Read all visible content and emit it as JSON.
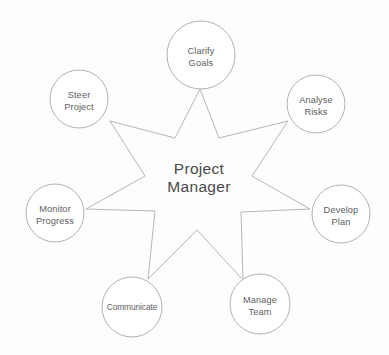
{
  "diagram": {
    "type": "star-hub-and-spoke",
    "center": {
      "name": "center-node",
      "line1": "Project",
      "line2": "Manager",
      "x": 199,
      "y": 174
    },
    "stroke_color": "#a8a8a8",
    "text_color": "#5d5d5d",
    "center_text_color": "#4a4a4a",
    "background_color": "#fdfdfd",
    "nodes": [
      {
        "id": "clarify-goals",
        "line1": "Clarify",
        "line2": "Goals",
        "cx": 201,
        "cy": 55,
        "r": 34,
        "tight": false
      },
      {
        "id": "analyse-risks",
        "line1": "Analyse",
        "line2": "Risks",
        "cx": 316,
        "cy": 104,
        "r": 29,
        "tight": false
      },
      {
        "id": "develop-plan",
        "line1": "Develop",
        "line2": "Plan",
        "cx": 341,
        "cy": 214,
        "r": 29,
        "tight": false
      },
      {
        "id": "manage-team",
        "line1": "Manage",
        "line2": "Team",
        "cx": 260,
        "cy": 304,
        "r": 30,
        "tight": false
      },
      {
        "id": "communicate",
        "line1": "Communicate",
        "line2": "",
        "cx": 132,
        "cy": 307,
        "r": 30,
        "tight": true
      },
      {
        "id": "monitor-progress",
        "line1": "Monitor",
        "line2": "Progress",
        "cx": 55,
        "cy": 213,
        "r": 29,
        "tight": false
      },
      {
        "id": "steer-project",
        "line1": "Steer",
        "line2": "Project",
        "cx": 79,
        "cy": 99,
        "r": 29,
        "tight": false
      }
    ],
    "star_path": "M 200 89 L 175 138 L 110 121 L 145 176 L 86 209 L 155 211 L 148 279 L 197 230 L 243 280 L 241 212 L 310 209 L 252 176 L 288 121 L 219 138 Z"
  }
}
